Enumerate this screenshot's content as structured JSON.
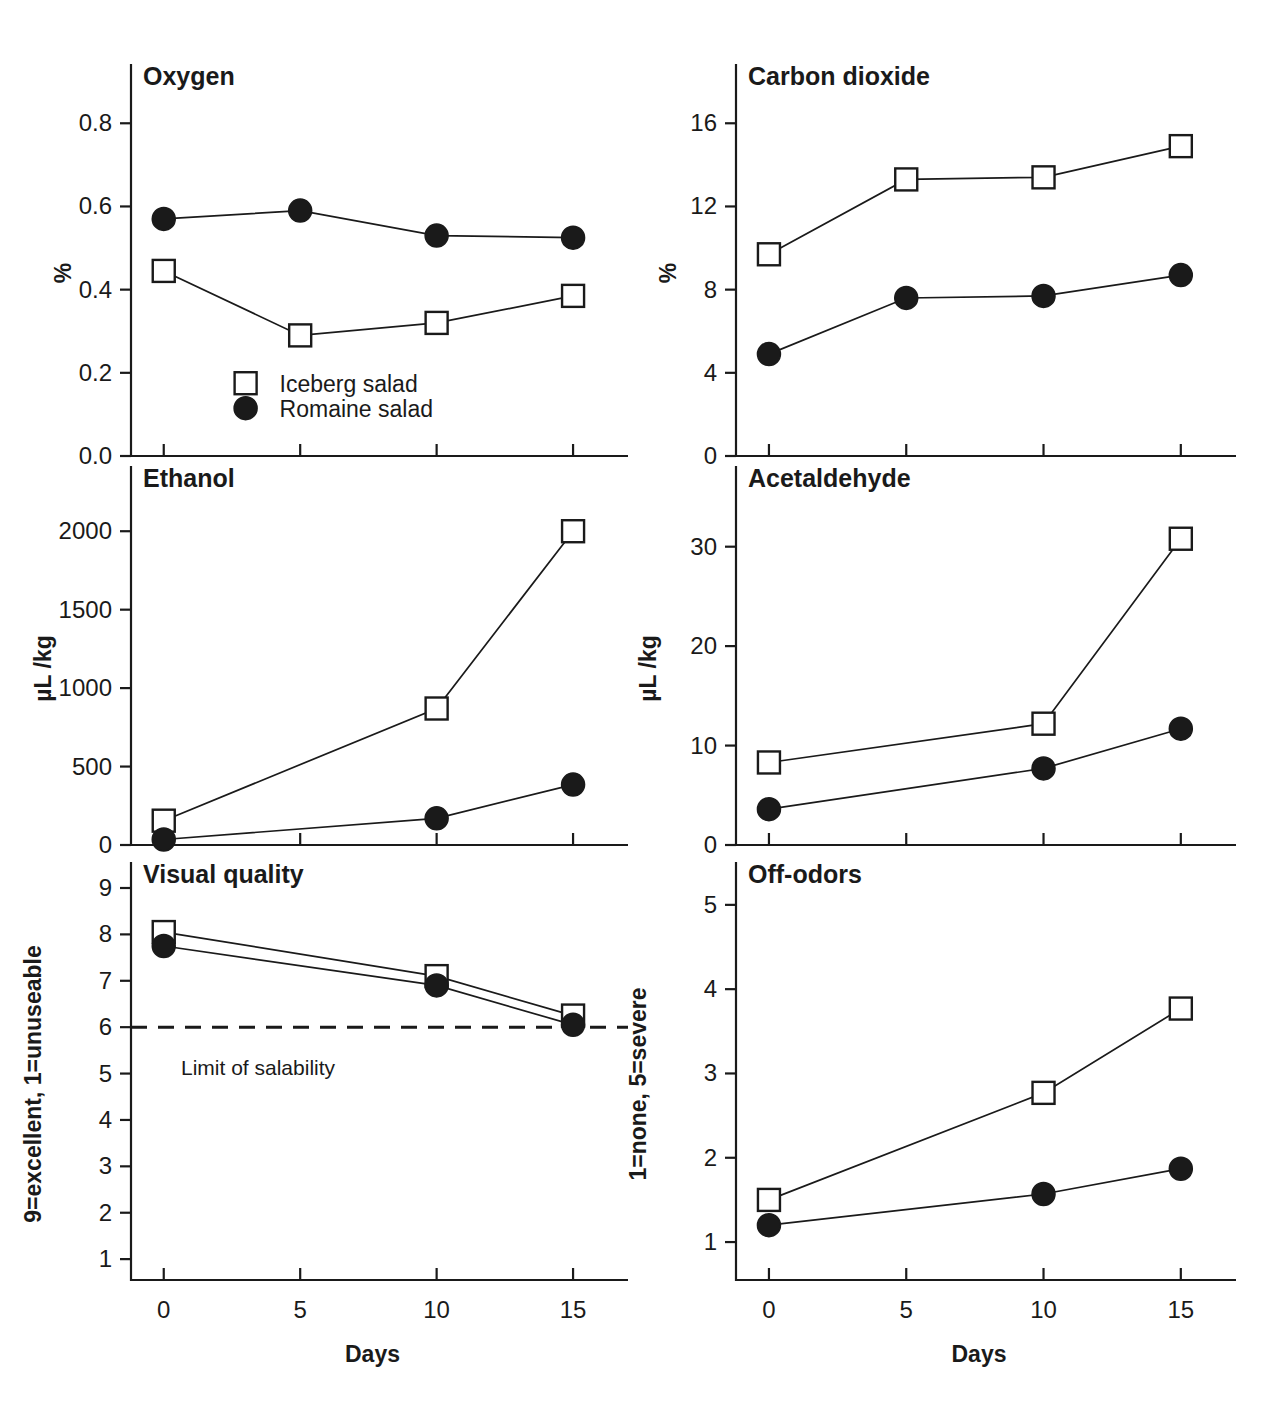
{
  "figure": {
    "legend": {
      "iceberg_label": "Iceberg salad",
      "romaine_label": "Romaine salad",
      "iceberg_marker": "open-square",
      "romaine_marker": "filled-circle"
    },
    "xaxis_title": "Days",
    "colors": {
      "ink": "#1a1a1a",
      "paper": "#ffffff"
    }
  },
  "chart_data": [
    {
      "type": "line",
      "panel": "oxygen",
      "title": "Oxygen",
      "xlabel": "Days",
      "ylabel": "%",
      "x": [
        0,
        5,
        10,
        15
      ],
      "xticks": [
        0,
        5,
        10,
        15
      ],
      "xticklabels": [
        "0",
        "5",
        "10",
        "15"
      ],
      "xlim": [
        -1.2,
        16.5
      ],
      "yticks": [
        0.0,
        0.2,
        0.4,
        0.6,
        0.8
      ],
      "yticklabels": [
        "0.0",
        "0.2",
        "0.4",
        "0.6",
        "0.8"
      ],
      "ylim": [
        0.0,
        0.88
      ],
      "grid": false,
      "legend_position": "lower-left-inside",
      "series": [
        {
          "name": "Iceberg salad",
          "marker": "open-square",
          "values": [
            0.445,
            0.29,
            0.32,
            0.385
          ]
        },
        {
          "name": "Romaine salad",
          "marker": "filled-circle",
          "values": [
            0.57,
            0.59,
            0.53,
            0.525
          ]
        }
      ]
    },
    {
      "type": "line",
      "panel": "carbon-dioxide",
      "title": "Carbon dioxide",
      "xlabel": "Days",
      "ylabel": "%",
      "x": [
        0,
        5,
        10,
        15
      ],
      "xticks": [
        0,
        5,
        10,
        15
      ],
      "xticklabels": [
        "0",
        "5",
        "10",
        "15"
      ],
      "xlim": [
        -1.2,
        16.5
      ],
      "yticks": [
        0,
        4,
        8,
        12,
        16
      ],
      "yticklabels": [
        "0",
        "4",
        "8",
        "12",
        "16"
      ],
      "ylim": [
        0,
        17.6
      ],
      "grid": false,
      "series": [
        {
          "name": "Iceberg salad",
          "marker": "open-square",
          "values": [
            9.7,
            13.3,
            13.4,
            14.9
          ]
        },
        {
          "name": "Romaine salad",
          "marker": "filled-circle",
          "values": [
            4.9,
            7.6,
            7.7,
            8.7
          ]
        }
      ]
    },
    {
      "type": "line",
      "panel": "ethanol",
      "title": "Ethanol",
      "xlabel": "Days",
      "ylabel": "µL /kg",
      "x": [
        0,
        10,
        15
      ],
      "xticks": [
        0,
        5,
        10,
        15
      ],
      "xticklabels": [
        "0",
        "5",
        "10",
        "15"
      ],
      "xlim": [
        -1.2,
        16.5
      ],
      "yticks": [
        0,
        500,
        1000,
        1500,
        2000
      ],
      "yticklabels": [
        "0",
        "500",
        "1000",
        "1500",
        "2000"
      ],
      "ylim": [
        0,
        2250
      ],
      "grid": false,
      "series": [
        {
          "name": "Iceberg salad",
          "marker": "open-square",
          "values": [
            155,
            870,
            2000
          ]
        },
        {
          "name": "Romaine salad",
          "marker": "filled-circle",
          "values": [
            35,
            170,
            385
          ]
        }
      ]
    },
    {
      "type": "line",
      "panel": "acetaldehyde",
      "title": "Acetaldehyde",
      "xlabel": "Days",
      "ylabel": "µL /kg",
      "x": [
        0,
        10,
        15
      ],
      "xticks": [
        0,
        5,
        10,
        15
      ],
      "xticklabels": [
        "0",
        "5",
        "10",
        "15"
      ],
      "xlim": [
        -1.2,
        16.5
      ],
      "yticks": [
        0,
        10,
        20,
        30
      ],
      "yticklabels": [
        "0",
        "10",
        "20",
        "30"
      ],
      "ylim": [
        0,
        35.5
      ],
      "grid": false,
      "series": [
        {
          "name": "Iceberg salad",
          "marker": "open-square",
          "values": [
            8.3,
            12.2,
            30.8
          ]
        },
        {
          "name": "Romaine salad",
          "marker": "filled-circle",
          "values": [
            3.6,
            7.7,
            11.7
          ]
        }
      ]
    },
    {
      "type": "line",
      "panel": "visual-quality",
      "title": "Visual quality",
      "xlabel": "Days",
      "ylabel": "9=excellent, 1=unuseable",
      "x": [
        0,
        10,
        15
      ],
      "xticks": [
        0,
        5,
        10,
        15
      ],
      "xticklabels": [
        "0",
        "5",
        "10",
        "15"
      ],
      "xlim": [
        -1.2,
        16.5
      ],
      "yticks": [
        1,
        2,
        3,
        4,
        5,
        6,
        7,
        8,
        9
      ],
      "yticklabels": [
        "1",
        "2",
        "3",
        "4",
        "5",
        "6",
        "7",
        "8",
        "9"
      ],
      "ylim": [
        0.55,
        9
      ],
      "grid": false,
      "annotations": [
        {
          "text": "Limit of salability",
          "value": 6,
          "style": "dashed-horizontal-line"
        }
      ],
      "series": [
        {
          "name": "Iceberg salad",
          "marker": "open-square",
          "values": [
            8.05,
            7.1,
            6.25
          ]
        },
        {
          "name": "Romaine salad",
          "marker": "filled-circle",
          "values": [
            7.75,
            6.9,
            6.05
          ]
        }
      ]
    },
    {
      "type": "line",
      "panel": "off-odors",
      "title": "Off-odors",
      "xlabel": "Days",
      "ylabel": "1=none, 5=severe",
      "x": [
        0,
        10,
        15
      ],
      "xticks": [
        0,
        5,
        10,
        15
      ],
      "xticklabels": [
        "0",
        "5",
        "10",
        "15"
      ],
      "xlim": [
        -1.2,
        16.5
      ],
      "yticks": [
        1,
        2,
        3,
        4,
        5
      ],
      "yticklabels": [
        "1",
        "2",
        "3",
        "4",
        "5"
      ],
      "ylim": [
        0.55,
        5.2
      ],
      "grid": false,
      "series": [
        {
          "name": "Iceberg salad",
          "marker": "open-square",
          "values": [
            1.5,
            2.77,
            3.77
          ]
        },
        {
          "name": "Romaine salad",
          "marker": "filled-circle",
          "values": [
            1.2,
            1.57,
            1.87
          ]
        }
      ]
    }
  ]
}
